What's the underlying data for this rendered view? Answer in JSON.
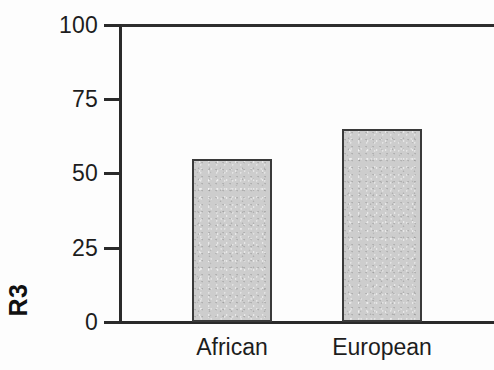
{
  "chart_data": {
    "type": "bar",
    "title": "",
    "subtitle": "",
    "xlabel": "",
    "ylabel": "R3",
    "categories": [
      "African",
      "European"
    ],
    "values": [
      55,
      65
    ],
    "series": [
      {
        "name": "R3",
        "values": [
          55,
          65
        ]
      }
    ],
    "ylim": [
      0,
      100
    ],
    "yticks": [
      0,
      25,
      50,
      75,
      100
    ],
    "ytick_labels": [
      "0",
      "25",
      "50",
      "75",
      "100"
    ],
    "grid": false,
    "legend": false,
    "legend_position": "none",
    "bar_fill_color": "#cdcdcd",
    "bar_border_color": "#3a3a3a",
    "axis_color": "#2a2a2a",
    "background_color": "#ffffff"
  }
}
